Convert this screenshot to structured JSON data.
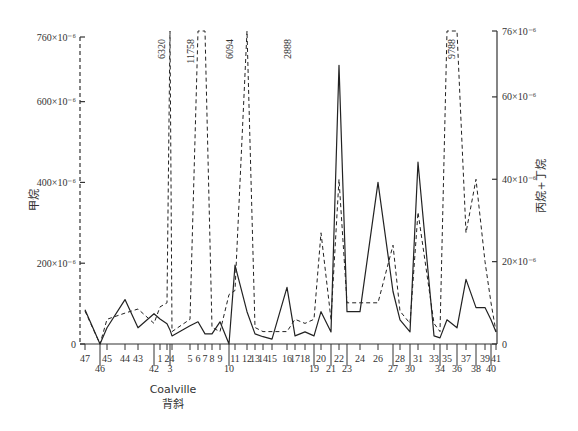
{
  "chart_data": {
    "type": "line",
    "title": "",
    "xlabel": "Coalville 背斜",
    "xlabel_line1": "Coalville",
    "xlabel_line2": "背斜",
    "ylabel": "甲烷",
    "ylabel_right": "丙烷+丁烷",
    "ylim": [
      0,
      760
    ],
    "ylim_right": [
      0,
      76
    ],
    "y_unit": "×10⁻⁶",
    "left_ticks": [
      {
        "value": 0,
        "label": "0"
      },
      {
        "value": 200,
        "label": "200×10⁻⁶"
      },
      {
        "value": 400,
        "label": "400×10⁻⁶"
      },
      {
        "value": 600,
        "label": "600×10⁻⁶"
      },
      {
        "value": 760,
        "label": "760×10⁻⁶"
      }
    ],
    "right_ticks": [
      {
        "value": 0,
        "label": "0"
      },
      {
        "value": 20,
        "label": "20×10⁻⁶"
      },
      {
        "value": 40,
        "label": "40×10⁻⁶"
      },
      {
        "value": 60,
        "label": "60×10⁻⁶"
      },
      {
        "value": 76,
        "label": "76×10⁻⁶"
      }
    ],
    "grid": false,
    "legend": null,
    "categories": [
      "47",
      "46",
      "45",
      "44",
      "43",
      "42",
      "1",
      "2",
      "3",
      "4",
      "5",
      "6",
      "7",
      "8",
      "9",
      "10",
      "11",
      "12",
      "13",
      "14",
      "15",
      "16",
      "17",
      "18",
      "19",
      "20",
      "21",
      "22",
      "23",
      "24",
      "26",
      "27",
      "28",
      "30",
      "31",
      "33",
      "34",
      "35",
      "36",
      "37",
      "38",
      "39",
      "40",
      "41"
    ],
    "x_positions": [
      85,
      100,
      107,
      125,
      138,
      154,
      160,
      167,
      170,
      172,
      190,
      198,
      205,
      212,
      220,
      229,
      235,
      247,
      255,
      263,
      272,
      287,
      295,
      305,
      314,
      321,
      331,
      339,
      347,
      360,
      378,
      393,
      400,
      410,
      418,
      434,
      440,
      447,
      457,
      466,
      476,
      485,
      491,
      496
    ],
    "series": [
      {
        "name": "甲烷 (methane, solid, left axis)",
        "style": "solid",
        "axis": "left",
        "values": [
          85,
          0,
          40,
          110,
          40,
          75,
          62,
          50,
          35,
          20,
          45,
          55,
          25,
          25,
          55,
          0,
          195,
          80,
          25,
          18,
          12,
          140,
          20,
          30,
          20,
          80,
          30,
          690,
          80,
          80,
          400,
          130,
          60,
          30,
          450,
          20,
          15,
          60,
          40,
          160,
          90,
          90,
          60,
          30
        ]
      },
      {
        "name": "丙烷+丁烷 (propane+butane, dashed, right axis)",
        "style": "dashed",
        "axis": "right",
        "values": [
          8,
          0,
          6,
          7.5,
          8.5,
          5,
          9,
          10,
          76,
          3,
          6,
          76,
          76,
          4,
          3,
          12,
          13,
          76,
          4,
          3,
          3,
          3,
          6,
          5,
          6,
          27,
          6,
          40,
          10,
          10,
          10,
          24,
          8,
          5,
          32,
          5,
          3,
          76,
          76,
          27,
          40,
          20,
          10,
          3
        ]
      }
    ],
    "off_scale_annotations": [
      {
        "category": "1-2",
        "label": "6320"
      },
      {
        "category": "5-6",
        "label": "11758"
      },
      {
        "category": "10-11",
        "label": "6094"
      },
      {
        "category": "15-16",
        "label": "2888"
      },
      {
        "category": "34-36",
        "label": "9788"
      }
    ]
  }
}
